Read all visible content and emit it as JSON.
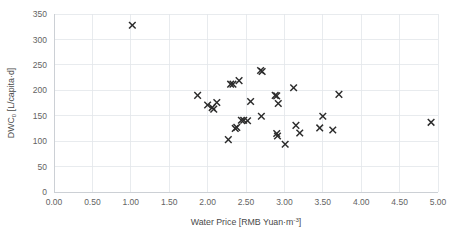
{
  "chart_data": {
    "type": "scatter",
    "title": "",
    "xlabel": "Water Price [RMB Yuan·m⁻³]",
    "xlabel_main": "Water Price [RMB Yuan·m",
    "xlabel_exponent": "-3",
    "xlabel_tail": "]",
    "ylabel": "DWC₀  [L/capita·d]",
    "ylabel_main": "DWC",
    "ylabel_subscript": "0",
    "ylabel_tail": "  [L/capita·d]",
    "xlim": [
      0.0,
      5.0
    ],
    "ylim": [
      0,
      350
    ],
    "xticks": [
      0.0,
      0.5,
      1.0,
      1.5,
      2.0,
      2.5,
      3.0,
      3.5,
      4.0,
      4.5,
      5.0
    ],
    "xtick_labels": [
      "0.00",
      "0.50",
      "1.00",
      "1.50",
      "2.00",
      "2.50",
      "3.00",
      "3.50",
      "4.00",
      "4.50",
      "5.00"
    ],
    "yticks": [
      0,
      50,
      100,
      150,
      200,
      250,
      300,
      350
    ],
    "ytick_labels": [
      "0",
      "50",
      "100",
      "150",
      "200",
      "250",
      "300",
      "350"
    ],
    "grid": true,
    "grid_color": "#e2e6ea",
    "legend": null,
    "marker": "x",
    "marker_color": "#2b2b2b",
    "series": [
      {
        "name": "cities",
        "points": [
          [
            1.02,
            328
          ],
          [
            1.87,
            190
          ],
          [
            2.0,
            171
          ],
          [
            2.06,
            166
          ],
          [
            2.08,
            163
          ],
          [
            2.12,
            176
          ],
          [
            2.27,
            103
          ],
          [
            2.3,
            212
          ],
          [
            2.33,
            212
          ],
          [
            2.36,
            125
          ],
          [
            2.38,
            127
          ],
          [
            2.41,
            219
          ],
          [
            2.44,
            141
          ],
          [
            2.47,
            141
          ],
          [
            2.52,
            140
          ],
          [
            2.56,
            178
          ],
          [
            2.69,
            239
          ],
          [
            2.71,
            237
          ],
          [
            2.7,
            149
          ],
          [
            2.88,
            190
          ],
          [
            2.9,
            189
          ],
          [
            2.92,
            174
          ],
          [
            2.9,
            115
          ],
          [
            2.91,
            110
          ],
          [
            3.01,
            94
          ],
          [
            3.12,
            205
          ],
          [
            3.15,
            131
          ],
          [
            3.2,
            116
          ],
          [
            3.46,
            126
          ],
          [
            3.5,
            149
          ],
          [
            3.63,
            122
          ],
          [
            3.71,
            192
          ],
          [
            4.91,
            137
          ]
        ]
      }
    ]
  },
  "figure": {
    "background_color": "#ffffff",
    "plot_left_px": 54,
    "plot_right_px": 438,
    "plot_top_px": 14,
    "plot_bottom_px": 192
  }
}
